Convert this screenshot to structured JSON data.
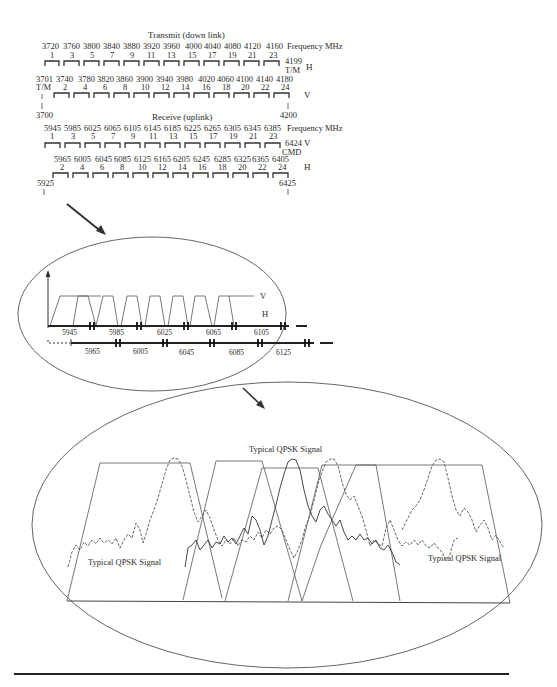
{
  "transmit": {
    "title": "Transmit (down link)",
    "freq_label": "Frequency MHz",
    "odd_freqs": [
      "3720",
      "3760",
      "3800",
      "3840",
      "3880",
      "3920",
      "3960",
      "4000",
      "4040",
      "4080",
      "4120",
      "4160"
    ],
    "odd_channels": [
      "1",
      "3",
      "5",
      "7",
      "9",
      "11",
      "13",
      "15",
      "17",
      "19",
      "21",
      "23"
    ],
    "odd_end_freq": "4199",
    "odd_end_tag": "T/M",
    "odd_pol": "H",
    "even_start_freq": "3701",
    "even_start_tag": "T/M",
    "even_freqs": [
      "3740",
      "3780",
      "3820",
      "3860",
      "3900",
      "3940",
      "3980",
      "4020",
      "4060",
      "4100",
      "4140",
      "4180"
    ],
    "even_channels": [
      "2",
      "4",
      "6",
      "8",
      "10",
      "12",
      "14",
      "16",
      "18",
      "20",
      "22",
      "24"
    ],
    "even_pol": "V",
    "band_start": "3700",
    "band_end": "4200"
  },
  "receive": {
    "title": "Receive (uplink)",
    "freq_label": "Frequency MHz",
    "odd_freqs": [
      "5945",
      "5985",
      "6025",
      "6065",
      "6105",
      "6145",
      "6185",
      "6225",
      "6265",
      "6305",
      "6345",
      "6385"
    ],
    "odd_channels": [
      "1",
      "3",
      "5",
      "7",
      "9",
      "11",
      "13",
      "15",
      "17",
      "19",
      "21",
      "23"
    ],
    "odd_end_freq": "6424",
    "odd_end_tag": "CMD",
    "odd_pol": "V",
    "even_freqs": [
      "5965",
      "6005",
      "6045",
      "6085",
      "6125",
      "6165",
      "6205",
      "6245",
      "6285",
      "6325",
      "6365",
      "6405"
    ],
    "even_channels": [
      "2",
      "4",
      "6",
      "8",
      "10",
      "12",
      "14",
      "16",
      "18",
      "20",
      "22",
      "24"
    ],
    "even_pol": "H",
    "band_start": "5925",
    "band_end": "6425"
  },
  "zoom_oval": {
    "pol_v": "V",
    "pol_h": "H",
    "upper_freqs": [
      "5945",
      "5985",
      "6025",
      "6065",
      "6105"
    ],
    "lower_freqs": [
      "5965",
      "6005",
      "6045",
      "6085",
      "6125"
    ]
  },
  "detail_oval": {
    "labels": [
      "Typical QPSK Signal",
      "Typical QPSK Signal",
      "Typical QPSK Signal"
    ]
  }
}
